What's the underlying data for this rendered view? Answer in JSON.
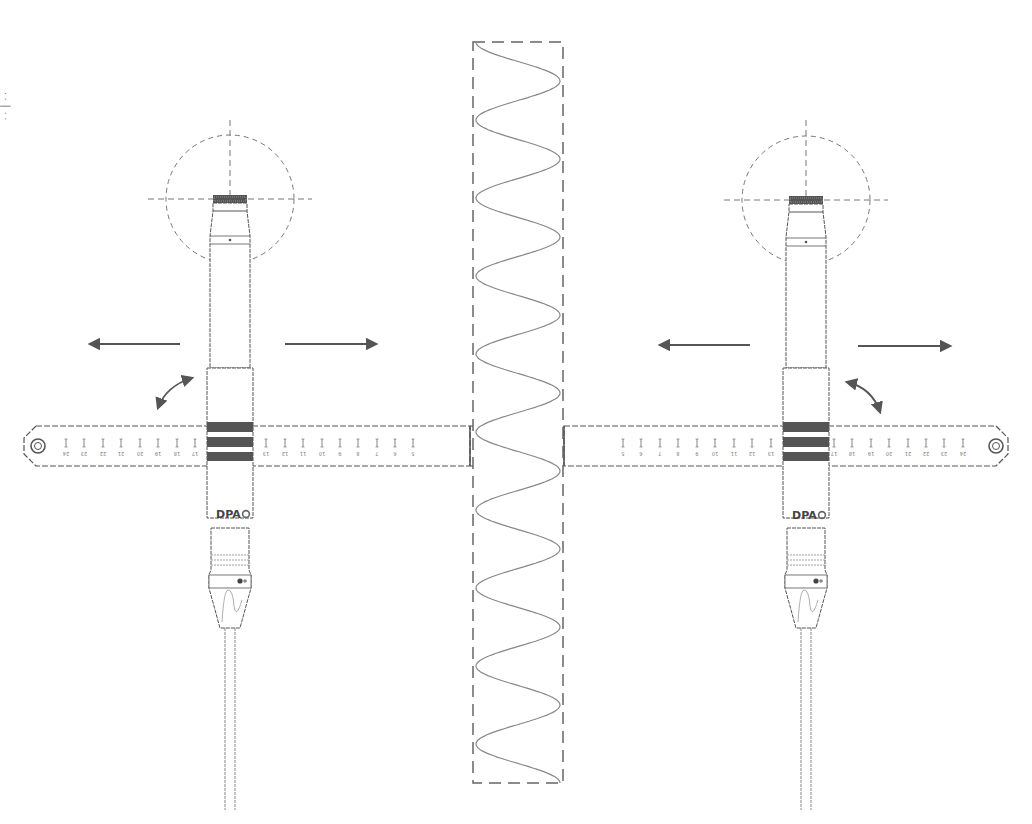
{
  "diagram": {
    "edge_text": "· · │ · ·",
    "left_mic": {
      "brand": "DPA",
      "center_x": 230,
      "ruler_labels": [
        "24",
        "23",
        "22",
        "21",
        "20",
        "19",
        "18",
        "17",
        "13",
        "12",
        "11",
        "10",
        "9",
        "8",
        "7",
        "6",
        "5"
      ]
    },
    "right_mic": {
      "brand": "DPA",
      "center_x": 806,
      "ruler_labels": [
        "5",
        "6",
        "7",
        "8",
        "9",
        "10",
        "11",
        "12",
        "13",
        "17",
        "18",
        "19",
        "20",
        "21",
        "22",
        "23",
        "24"
      ]
    },
    "center_element": {
      "type": "sine-wave-separator",
      "periods": 9.5
    },
    "annotations": {
      "translate_arrows": "move-left / move-right",
      "rotate_arrows": "angle-adjust"
    },
    "colors": {
      "line": "#555555",
      "dashed": "#777777",
      "band": "#555555",
      "wave": "#888888"
    }
  }
}
